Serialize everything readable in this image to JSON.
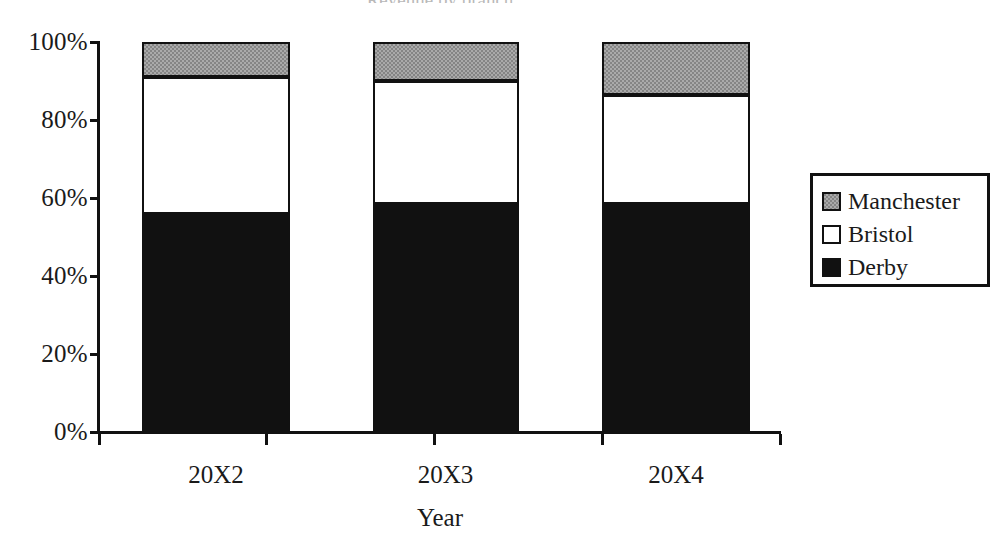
{
  "chart_data": {
    "type": "bar",
    "subtype": "stacked-100-percent",
    "title": "",
    "title_remnant": "Revenue by branch",
    "xlabel": "Year",
    "ylabel": "",
    "categories": [
      "20X2",
      "20X3",
      "20X4"
    ],
    "ytick_labels": [
      "100%",
      "80%",
      "60%",
      "40%",
      "20%",
      "0%"
    ],
    "ytick_values": [
      100,
      80,
      60,
      40,
      20,
      0
    ],
    "ylim": [
      0,
      100
    ],
    "grid": false,
    "legend_position": "right",
    "series": [
      {
        "name": "Derby",
        "color": "#111111",
        "swatch": "black",
        "values": [
          56,
          58.5,
          58.5
        ]
      },
      {
        "name": "Bristol",
        "color": "#ffffff",
        "swatch": "white",
        "values": [
          35,
          31.5,
          28
        ]
      },
      {
        "name": "Manchester",
        "color": "#858585",
        "swatch": "gray",
        "values": [
          9,
          10,
          13.5
        ]
      }
    ],
    "legend_order": [
      "Manchester",
      "Bristol",
      "Derby"
    ]
  },
  "axis": {
    "y_ticks": [
      {
        "label": "100%",
        "value": 100
      },
      {
        "label": "80%",
        "value": 80
      },
      {
        "label": "60%",
        "value": 60
      },
      {
        "label": "40%",
        "value": 40
      },
      {
        "label": "20%",
        "value": 20
      },
      {
        "label": "0%",
        "value": 0
      }
    ],
    "x_title": "Year",
    "x_labels": [
      "20X2",
      "20X3",
      "20X4"
    ]
  },
  "legend": {
    "items": [
      {
        "label": "Manchester",
        "swatch": "gray"
      },
      {
        "label": "Bristol",
        "swatch": "white"
      },
      {
        "label": "Derby",
        "swatch": "black"
      }
    ]
  }
}
